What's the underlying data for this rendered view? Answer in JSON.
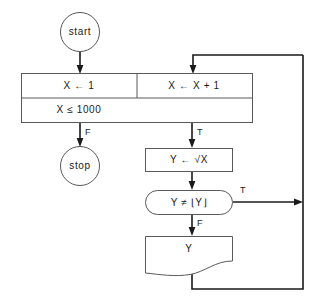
{
  "diagram": {
    "type": "flowchart",
    "nodes": {
      "start": {
        "label": "start",
        "shape": "circle"
      },
      "init": {
        "label": "X ← 1",
        "shape": "process"
      },
      "increment": {
        "label": "X ← X + 1",
        "shape": "process"
      },
      "condition": {
        "label": "X ≤ 1000",
        "shape": "process-wide"
      },
      "stop": {
        "label": "stop",
        "shape": "circle"
      },
      "assign_sqrt": {
        "label": "Y ← √X",
        "shape": "process"
      },
      "test_floor": {
        "label": "Y ≠ ⌊Y⌋",
        "shape": "decision-stadium"
      },
      "output": {
        "label": "Y",
        "shape": "document"
      }
    },
    "edge_labels": {
      "condition_false": "F",
      "condition_true": "T",
      "test_true": "T",
      "test_false": "F"
    },
    "colors": {
      "background": "#ffffff",
      "shape_stroke": "#5a5a5a",
      "connector": "#1a1a1a",
      "text": "#1a1a1a"
    }
  }
}
